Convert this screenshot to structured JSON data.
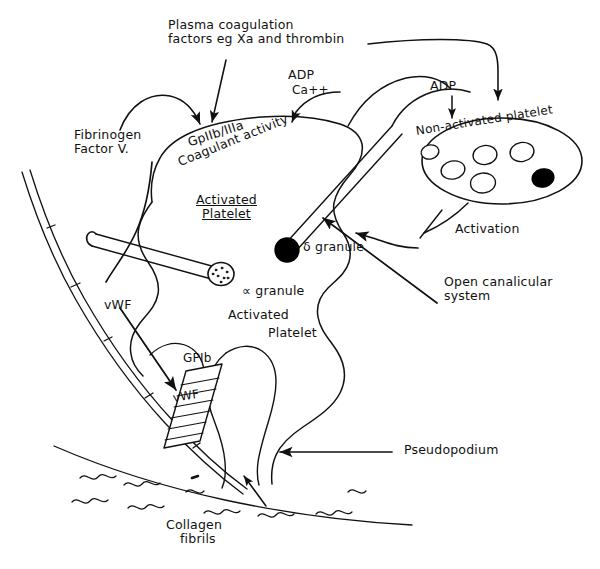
{
  "figure": {
    "background_color": "#ffffff",
    "ink_color": "#111111",
    "width": 600,
    "height": 569
  },
  "labels": {
    "plasma_factors_line1": "Plasma coagulation",
    "plasma_factors_line2": "factors eg Xa and thrombin",
    "adp_left": "ADP",
    "ca_left": "Ca++",
    "adp_right": "ADP",
    "fibrinogen_line1": "Fibrinogen",
    "fibrinogen_line2": "Factor V.",
    "gpiibiiia": "GpIIb/IIIa",
    "coagulant_activity": "Coagulant activity",
    "activated_platelet_line1": "Activated",
    "activated_platelet_line2": "Platelet",
    "non_activated_platelet": "Non-activated platelet",
    "activation": "Activation",
    "delta_granule": "δ granule",
    "alpha_granule": "∝ granule",
    "open_canalicular_line1": "Open canalicular",
    "open_canalicular_line2": "system",
    "vwf_arrow_label": "vWF",
    "vwf_box_label": "vWF",
    "gpib": "GPIb",
    "activated_platelet_body_line1": "Activated",
    "activated_platelet_body_line2": "Platelet",
    "pseudopodium": "Pseudopodium",
    "collagen_line1": "Collagen",
    "collagen_line2": "fibrils"
  },
  "non_activated_platelet": {
    "granules_open_count": 5,
    "granules_dense_count": 1,
    "dense_granule_color": "#000000",
    "open_granule_fill": "#ffffff"
  },
  "granule_stalks": [
    {
      "name": "delta-granule",
      "fill": "#000000"
    },
    {
      "name": "alpha-granule",
      "fill": "#ffffff"
    }
  ],
  "vwf_box": {
    "hatch_line_count": 7,
    "fill": "#ffffff"
  },
  "collagen_fibrils": {
    "squiggle_count": 9
  }
}
